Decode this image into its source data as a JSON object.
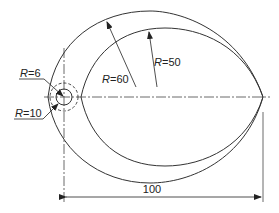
{
  "diagram": {
    "type": "engineering-drawing",
    "labels": {
      "r6": {
        "r": "R",
        "eq": "=6"
      },
      "r10": {
        "r": "R",
        "eq": "=10"
      },
      "r60": {
        "r": "R",
        "eq": "=60"
      },
      "r50": {
        "r": "R",
        "eq": "=50"
      },
      "dim100": "100"
    },
    "colors": {
      "line": "#333333",
      "background": "#ffffff"
    }
  }
}
